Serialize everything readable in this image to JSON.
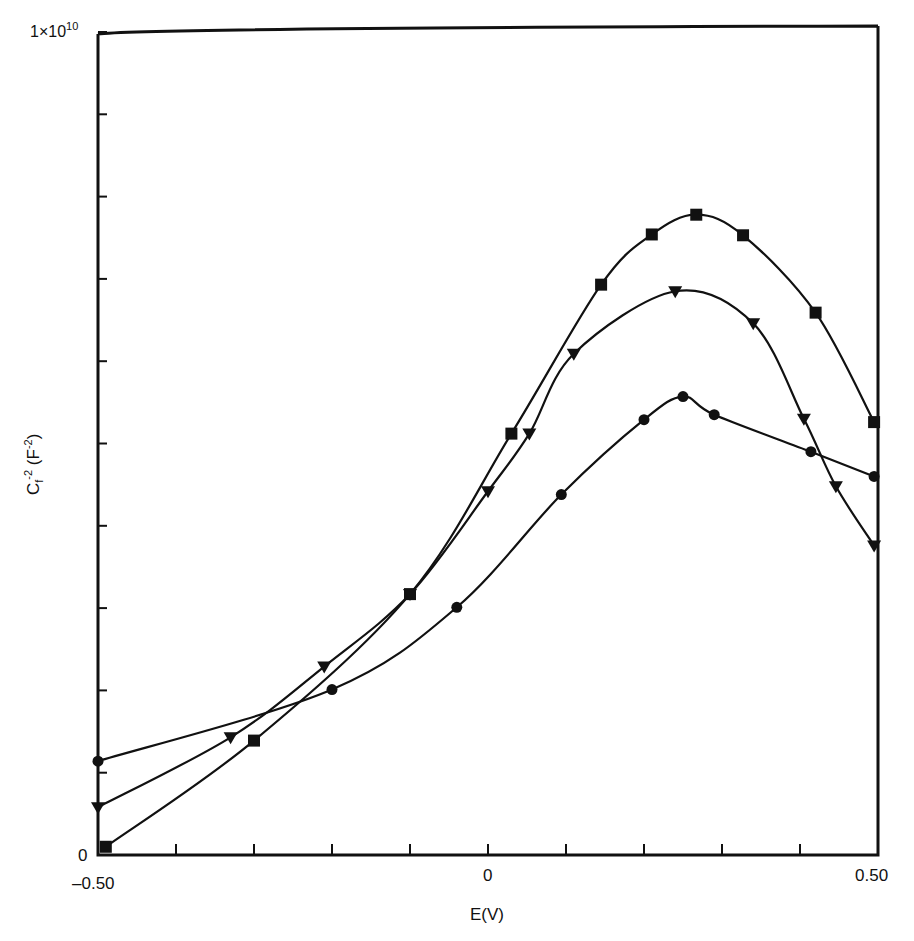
{
  "chart_data": {
    "type": "line",
    "title": "",
    "xlabel": "E(V)",
    "ylabel": "C_f^-2 (F^-2)",
    "ylabel_parts": {
      "base": "C",
      "sub": "f",
      "sup": "-2",
      "unit": "(F",
      "unit_sup": "-2",
      "unit_close": ")"
    },
    "xlim": [
      -0.5,
      0.5
    ],
    "ylim": [
      0,
      10000000000.0
    ],
    "x_tick_labels": [
      "-0.50",
      "0",
      "0.50"
    ],
    "x_ticks": [
      -0.5,
      -0.4,
      -0.3,
      -0.2,
      -0.1,
      0,
      0.1,
      0.2,
      0.3,
      0.4,
      0.5
    ],
    "y_tick_labels": [
      "0",
      "1×10",
      "10"
    ],
    "y_ticks": [
      0,
      1000000000.0,
      2000000000.0,
      3000000000.0,
      4000000000.0,
      5000000000.0,
      6000000000.0,
      7000000000.0,
      8000000000.0,
      9000000000.0,
      10000000000.0
    ],
    "grid": false,
    "legend": null,
    "y_units_note": "values in units of 1e9 F^-2",
    "series": [
      {
        "name": "squares",
        "marker": "square",
        "x": [
          -0.49,
          -0.3,
          -0.1,
          0.03,
          0.145,
          0.21,
          0.267,
          0.327,
          0.42,
          0.495
        ],
        "y": [
          0.1,
          1.39,
          3.17,
          5.12,
          6.93,
          7.54,
          7.78,
          7.53,
          6.59,
          5.26
        ]
      },
      {
        "name": "triangles",
        "marker": "triangle-down",
        "x": [
          -0.5,
          -0.33,
          -0.21,
          -0.1,
          0.0,
          0.053,
          0.11,
          0.24,
          0.34,
          0.405,
          0.446,
          0.495
        ],
        "y": [
          0.58,
          1.43,
          2.29,
          3.17,
          4.42,
          5.12,
          6.09,
          6.85,
          6.46,
          5.3,
          4.48,
          3.76
        ]
      },
      {
        "name": "circles",
        "marker": "circle",
        "x": [
          -0.5,
          -0.2,
          -0.04,
          0.094,
          0.2,
          0.25,
          0.29,
          0.414,
          0.495
        ],
        "y": [
          1.14,
          2.01,
          3.01,
          4.38,
          5.29,
          5.57,
          5.35,
          4.9,
          4.6
        ]
      }
    ],
    "colors": {
      "line": "#111111",
      "background": "#ffffff"
    }
  }
}
